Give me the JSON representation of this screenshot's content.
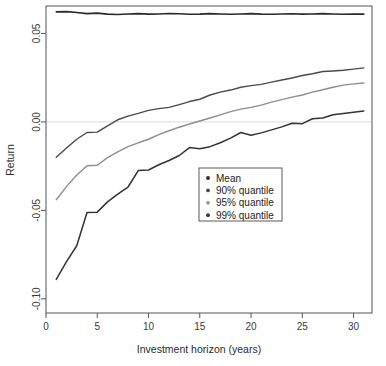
{
  "chart_data": {
    "type": "line",
    "title": "",
    "xlabel": "Investment horizon (years)",
    "ylabel": "Return",
    "xlim": [
      0,
      31.8
    ],
    "ylim": [
      -0.108,
      0.0655
    ],
    "xticks": [
      0,
      5,
      10,
      15,
      20,
      25,
      30
    ],
    "xtick_labels": [
      "0",
      "5",
      "10",
      "15",
      "20",
      "25",
      "30"
    ],
    "yticks": [
      0.05,
      0.0,
      -0.05,
      -0.1
    ],
    "ytick_labels": [
      "0.05",
      "0.00",
      "-0.05",
      "-0.10"
    ],
    "grid": false,
    "zero_line": true,
    "legend_position": "center-right-lower",
    "x": [
      1,
      2,
      3,
      4,
      5,
      6,
      7,
      8,
      9,
      10,
      11,
      12,
      13,
      14,
      15,
      16,
      17,
      18,
      19,
      20,
      21,
      22,
      23,
      24,
      25,
      26,
      27,
      28,
      29,
      30,
      31
    ],
    "series": [
      {
        "name": "Mean",
        "color": "#2a2a2a",
        "width": 1.6,
        "values": [
          0.0622,
          0.0623,
          0.0618,
          0.0612,
          0.0615,
          0.0609,
          0.0607,
          0.061,
          0.0612,
          0.0609,
          0.061,
          0.0613,
          0.0611,
          0.0608,
          0.0609,
          0.0612,
          0.061,
          0.0608,
          0.061,
          0.0612,
          0.0609,
          0.0608,
          0.061,
          0.0611,
          0.0609,
          0.061,
          0.0612,
          0.061,
          0.0608,
          0.061,
          0.0609
        ]
      },
      {
        "name": "90% quantile",
        "color": "#4a4a4a",
        "width": 1.4,
        "values": [
          -0.02,
          -0.0148,
          -0.0098,
          -0.006,
          -0.0058,
          -0.0022,
          0.0012,
          0.0033,
          0.0048,
          0.0065,
          0.0075,
          0.0082,
          0.0098,
          0.0115,
          0.0128,
          0.0152,
          0.0168,
          0.018,
          0.0196,
          0.0205,
          0.0212,
          0.0225,
          0.0237,
          0.0248,
          0.0262,
          0.0272,
          0.0285,
          0.0288,
          0.0292,
          0.0298,
          0.0305
        ]
      },
      {
        "name": "95% quantile",
        "color": "#8e8e8e",
        "width": 1.4,
        "values": [
          -0.044,
          -0.0366,
          -0.03,
          -0.0248,
          -0.0245,
          -0.0202,
          -0.017,
          -0.014,
          -0.0118,
          -0.0098,
          -0.0072,
          -0.005,
          -0.003,
          -0.0012,
          0.0005,
          0.0022,
          0.004,
          0.0058,
          0.0072,
          0.0082,
          0.0095,
          0.0112,
          0.0126,
          0.014,
          0.0152,
          0.0168,
          0.0182,
          0.0196,
          0.0208,
          0.0215,
          0.022
        ]
      },
      {
        "name": "99% quantile",
        "color": "#333333",
        "width": 1.5,
        "values": [
          -0.089,
          -0.079,
          -0.07,
          -0.0512,
          -0.051,
          -0.0452,
          -0.0408,
          -0.0368,
          -0.0275,
          -0.0272,
          -0.0242,
          -0.0218,
          -0.019,
          -0.0145,
          -0.0152,
          -0.014,
          -0.0118,
          -0.0092,
          -0.006,
          -0.0075,
          -0.0062,
          -0.0045,
          -0.0028,
          -0.0008,
          -0.001,
          0.0018,
          0.0022,
          0.004,
          0.0048,
          0.0055,
          0.0062
        ]
      }
    ],
    "legend_entries": [
      {
        "label": "Mean",
        "color": "#2a2a2a"
      },
      {
        "label": "90% quantile",
        "color": "#4a4a4a"
      },
      {
        "label": "95% quantile",
        "color": "#9a9a9a"
      },
      {
        "label": "99% quantile",
        "color": "#333333"
      }
    ]
  }
}
